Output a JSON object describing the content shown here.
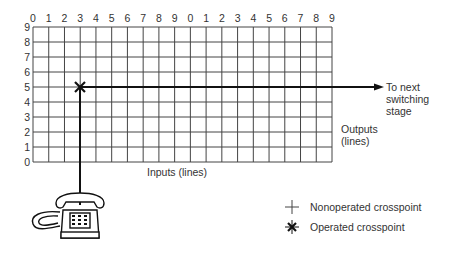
{
  "diagram": {
    "type": "crosspoint switching matrix",
    "grid": {
      "columns_label": "Inputs (lines)",
      "rows_label_line1": "Outputs",
      "rows_label_line2": "(lines)",
      "column_ticks": [
        "0",
        "1",
        "2",
        "3",
        "4",
        "5",
        "6",
        "7",
        "8",
        "9",
        "0",
        "1",
        "2",
        "3",
        "4",
        "5",
        "6",
        "7",
        "8",
        "9"
      ],
      "row_ticks": [
        "9",
        "8",
        "7",
        "6",
        "5",
        "4",
        "3",
        "2",
        "1",
        "0"
      ]
    },
    "operated_crosspoint": {
      "input": "3",
      "output": "5"
    },
    "arrow_label_line1": "To next",
    "arrow_label_line2": "switching",
    "arrow_label_line3": "stage",
    "legend": {
      "nonoperated": {
        "symbol": "plus-icon",
        "label": "Nonoperated crosspoint"
      },
      "operated": {
        "symbol": "asterisk-x-icon",
        "label": "Operated crosspoint"
      }
    },
    "device": "telephone-icon",
    "colors": {
      "line": "#222222",
      "grid": "#444444",
      "background": "#ffffff"
    }
  }
}
